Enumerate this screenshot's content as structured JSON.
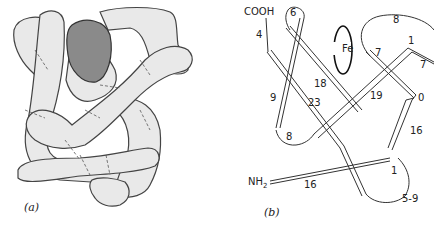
{
  "panel_a": {
    "caption": "(a)",
    "description": "stippled 3D tube rendering of folded protein chain"
  },
  "panel_b": {
    "caption": "(b)",
    "labels": {
      "cooh": "COOH",
      "nh2": "NH",
      "nh2_sub": "2",
      "fe": "Fe",
      "seg_6": "6",
      "seg_4": "4",
      "seg_8_top": "8",
      "seg_1_top": "1",
      "seg_7a": "7",
      "seg_7b": "7",
      "seg_18": "18",
      "seg_19": "19",
      "seg_0": "0",
      "seg_9": "9",
      "seg_23": "23",
      "seg_16_right": "16",
      "seg_8_bottom": "8",
      "seg_1_bottom": "1",
      "seg_16_bottom": "16",
      "seg_5_9": "5-9"
    }
  }
}
